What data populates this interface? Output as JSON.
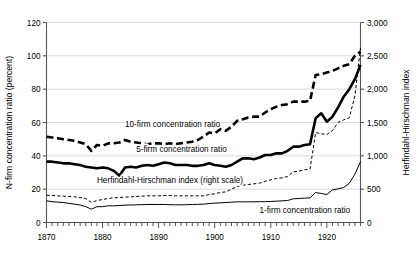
{
  "figure": {
    "title": "",
    "left_axis_title": "N-firm concentration ratio (percent)",
    "right_axis_title": "Herfindahl-Hirschman index"
  },
  "chart_data": {
    "type": "line",
    "title": "",
    "xlabel": "",
    "ylabel": "N-firm concentration ratio (percent)",
    "y2label": "Herfindahl-Hirschman index",
    "xlim": [
      1870,
      1926
    ],
    "ylim": [
      0,
      120
    ],
    "y2lim": [
      0,
      3000
    ],
    "grid": true,
    "grid_axis": "y",
    "legend": "inline-annotations",
    "xticks": [
      1870,
      1880,
      1890,
      1900,
      1910,
      1920
    ],
    "xtick_labels": [
      "1870",
      "1880",
      "1890",
      "1900",
      "1910",
      "1920"
    ],
    "xminor_tick_interval": 1,
    "yticks": [
      0,
      20,
      40,
      60,
      80,
      100,
      120
    ],
    "ytick_labels": [
      "0",
      "20",
      "40",
      "60",
      "80",
      "100",
      "120"
    ],
    "y2ticks": [
      0,
      500,
      1000,
      1500,
      2000,
      2500,
      3000
    ],
    "y2tick_labels": [
      "0",
      "500",
      "1,000",
      "1,500",
      "2,000",
      "2,500",
      "3,000"
    ],
    "x": [
      1870,
      1871,
      1872,
      1873,
      1874,
      1875,
      1876,
      1877,
      1878,
      1879,
      1880,
      1881,
      1882,
      1883,
      1884,
      1885,
      1886,
      1887,
      1888,
      1889,
      1890,
      1891,
      1892,
      1893,
      1894,
      1895,
      1896,
      1897,
      1898,
      1899,
      1900,
      1901,
      1902,
      1903,
      1904,
      1905,
      1906,
      1907,
      1908,
      1909,
      1910,
      1911,
      1912,
      1913,
      1914,
      1915,
      1916,
      1917,
      1918,
      1919,
      1920,
      1921,
      1922,
      1923,
      1924,
      1925,
      1926
    ],
    "series": [
      {
        "name": "10-firm concentration ratio",
        "axis": "left",
        "style": "heavy-dashed",
        "label_text": "10-firm concentration ratio",
        "values": [
          51.5,
          51.0,
          50.5,
          50.0,
          49.5,
          49.0,
          48.0,
          47.0,
          43.0,
          46.5,
          46.0,
          47.5,
          47.5,
          48.0,
          49.5,
          48.5,
          48.0,
          47.5,
          47.0,
          47.5,
          47.5,
          47.0,
          47.5,
          47.0,
          47.5,
          48.0,
          48.5,
          49.5,
          51.5,
          54.0,
          53.5,
          56.0,
          55.0,
          57.5,
          61.0,
          62.0,
          63.0,
          63.5,
          63.5,
          66.0,
          68.0,
          69.5,
          70.5,
          71.0,
          72.5,
          72.5,
          72.5,
          73.0,
          88.5,
          89.0,
          90.0,
          91.0,
          92.5,
          94.0,
          95.0,
          100.0,
          102.5
        ]
      },
      {
        "name": "5-firm concentration ratio",
        "axis": "left",
        "style": "heavy-solid",
        "label_text": "5-firm concentration ratio",
        "values": [
          36.5,
          36.5,
          36.0,
          35.5,
          35.5,
          35.0,
          34.5,
          33.5,
          33.0,
          32.5,
          33.0,
          32.5,
          31.0,
          28.0,
          33.0,
          33.5,
          33.0,
          34.0,
          34.5,
          34.0,
          35.0,
          36.0,
          35.5,
          34.5,
          34.5,
          34.5,
          34.0,
          34.0,
          34.5,
          35.5,
          34.5,
          34.0,
          33.5,
          34.5,
          36.5,
          38.5,
          38.5,
          38.0,
          39.0,
          40.5,
          40.5,
          41.5,
          41.5,
          43.0,
          45.5,
          45.5,
          46.5,
          47.0,
          62.5,
          65.5,
          60.5,
          63.5,
          69.0,
          75.5,
          80.0,
          86.0,
          94.5
        ]
      },
      {
        "name": "Herfindahl-Hirschman index (right scale)",
        "axis": "right",
        "style": "fine-dashed",
        "label_text": "Herfindahl-Hirschman index (right scale)",
        "values": [
          410,
          405,
          400,
          395,
          390,
          385,
          375,
          360,
          300,
          330,
          345,
          360,
          370,
          375,
          380,
          385,
          390,
          395,
          400,
          400,
          400,
          405,
          405,
          400,
          400,
          400,
          400,
          400,
          400,
          420,
          430,
          450,
          460,
          500,
          540,
          560,
          570,
          580,
          590,
          620,
          640,
          660,
          670,
          690,
          760,
          770,
          790,
          800,
          1350,
          1330,
          1320,
          1380,
          1500,
          1540,
          1570,
          1900,
          2620
        ]
      },
      {
        "name": "1-firm concentration ratio",
        "axis": "left",
        "style": "fine-solid",
        "label_text": "1-firm concentration ratio",
        "values": [
          13.0,
          12.5,
          12.2,
          12.0,
          11.5,
          11.0,
          10.5,
          9.5,
          8.0,
          9.5,
          9.5,
          10.0,
          10.0,
          10.2,
          10.4,
          10.5,
          10.6,
          10.7,
          10.8,
          10.8,
          10.8,
          10.8,
          10.7,
          10.6,
          10.6,
          10.7,
          10.8,
          10.9,
          11.0,
          11.4,
          11.6,
          11.8,
          12.0,
          12.2,
          12.4,
          12.4,
          12.4,
          12.4,
          12.5,
          12.5,
          12.6,
          12.8,
          13.0,
          13.2,
          14.2,
          14.4,
          14.6,
          14.8,
          18.0,
          17.4,
          16.8,
          19.6,
          20.2,
          21.0,
          23.5,
          29.0,
          36.5
        ]
      }
    ],
    "annotations": [
      {
        "text": "10-firm concentration ratio",
        "x": 1884,
        "y": 57.5
      },
      {
        "text": "5-firm concentration ratio",
        "x": 1886,
        "y": 42.5
      },
      {
        "text": "Herfindahl-Hirschman index (right scale)",
        "x": 1879,
        "y": 23.5
      },
      {
        "text": "1-firm concentration ratio",
        "x": 1908,
        "y": 5.5
      }
    ]
  }
}
